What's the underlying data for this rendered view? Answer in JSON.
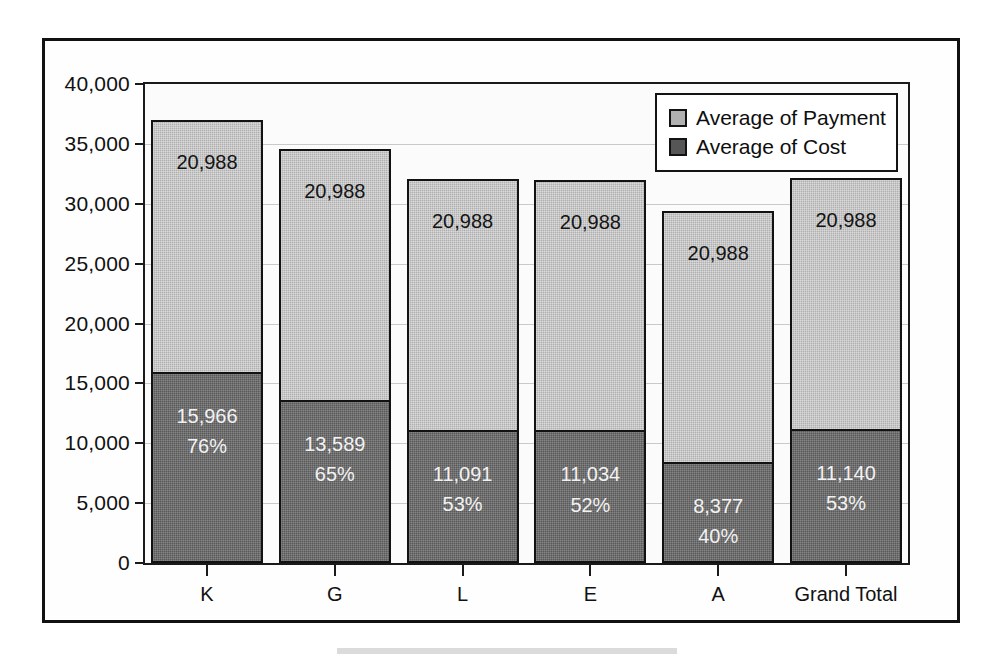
{
  "chart_data": {
    "type": "bar",
    "subtype": "stacked-column",
    "title": "",
    "xlabel": "",
    "ylabel": "",
    "categories": [
      "K",
      "G",
      "L",
      "E",
      "A",
      "Grand Total"
    ],
    "series": [
      {
        "name": "Average of Payment",
        "color": "#b0b0b0",
        "values": [
          20988,
          20988,
          20988,
          20988,
          20988,
          20988
        ],
        "labels": [
          "20,988",
          "20,988",
          "20,988",
          "20,988",
          "20,988",
          "20,988"
        ]
      },
      {
        "name": "Average of Cost",
        "color": "#595959",
        "values": [
          15966,
          13589,
          11091,
          11034,
          8377,
          11140
        ],
        "labels": [
          "15,966",
          "13,589",
          "11,091",
          "11,034",
          "8,377",
          "11,140"
        ],
        "percent_labels": [
          "76%",
          "65%",
          "53%",
          "52%",
          "40%",
          "53%"
        ]
      }
    ],
    "totals": [
      36954,
      34577,
      32079,
      32022,
      29365,
      32128
    ],
    "ylim": [
      0,
      40000
    ],
    "ytick_step": 5000,
    "ytick_labels": [
      "0",
      "5,000",
      "10,000",
      "15,000",
      "20,000",
      "25,000",
      "30,000",
      "35,000",
      "40,000"
    ],
    "ytick_values": [
      0,
      5000,
      10000,
      15000,
      20000,
      25000,
      30000,
      35000,
      40000
    ],
    "grid": true,
    "legend_position": "top-right"
  },
  "legend": {
    "items": [
      {
        "label": "Average of Payment",
        "swatch": "#b0b0b0"
      },
      {
        "label": "Average of Cost",
        "swatch": "#565656"
      }
    ]
  }
}
